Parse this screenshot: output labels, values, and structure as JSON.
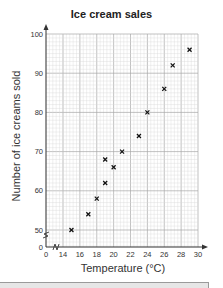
{
  "chart_data": {
    "type": "scatter",
    "title": "Ice cream sales",
    "xlabel": "Temperature (°C)",
    "ylabel": "Number of ice creams sold",
    "xlim": [
      14,
      30
    ],
    "ylim": [
      50,
      100
    ],
    "x_axis_break": true,
    "y_axis_break": true,
    "x_ticks": [
      "0",
      "14",
      "16",
      "18",
      "20",
      "22",
      "24",
      "26",
      "28",
      "30"
    ],
    "y_ticks": [
      "0",
      "50",
      "60",
      "70",
      "80",
      "90",
      "100"
    ],
    "grid": true,
    "marker": "x",
    "points": [
      {
        "x": 15,
        "y": 50
      },
      {
        "x": 17,
        "y": 54
      },
      {
        "x": 18,
        "y": 58
      },
      {
        "x": 19,
        "y": 62
      },
      {
        "x": 19,
        "y": 68
      },
      {
        "x": 20,
        "y": 66
      },
      {
        "x": 21,
        "y": 70
      },
      {
        "x": 23,
        "y": 74
      },
      {
        "x": 24,
        "y": 80
      },
      {
        "x": 26,
        "y": 86
      },
      {
        "x": 27,
        "y": 92
      },
      {
        "x": 29,
        "y": 96
      }
    ]
  },
  "colors": {
    "grid_minor": "#d9d9d9",
    "grid_major": "#a8a8a8",
    "axis": "#333333",
    "marker": "#111111",
    "panel": "#e6e6e6"
  }
}
